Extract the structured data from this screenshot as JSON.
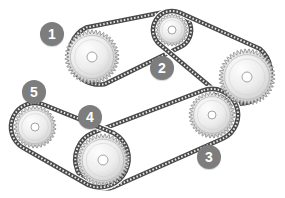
{
  "diagram": {
    "background_color": "#ffffff",
    "badge_color": "#7d7d7d",
    "badge_text_color": "#ffffff",
    "sprocket_fill_color": "#f2f2f2",
    "sprocket_tooth_color": "#a8a8a8",
    "sprocket_outline_color": "#8c8c8c",
    "chain_color": "#4a4a4a",
    "hub_color": "#ffffff"
  },
  "callouts": [
    {
      "id": "callout-1",
      "label": "1",
      "x": 40,
      "y": 22
    },
    {
      "id": "callout-2",
      "label": "2",
      "x": 150,
      "y": 56
    },
    {
      "id": "callout-3",
      "label": "3",
      "x": 197,
      "y": 145
    },
    {
      "id": "callout-4",
      "label": "4",
      "x": 78,
      "y": 105
    },
    {
      "id": "callout-5",
      "label": "5",
      "x": 22,
      "y": 80
    }
  ],
  "sprockets": [
    {
      "id": "sprocket-upper-left",
      "cx": 92,
      "cy": 57,
      "radius": 27,
      "teeth": 42,
      "hub_radius": 5
    },
    {
      "id": "sprocket-top-small",
      "cx": 172,
      "cy": 30,
      "radius": 16,
      "teeth": 26,
      "hub_radius": 4
    },
    {
      "id": "sprocket-right-large",
      "cx": 247,
      "cy": 77,
      "radius": 28,
      "teeth": 44,
      "hub_radius": 5
    },
    {
      "id": "sprocket-center-right",
      "cx": 212,
      "cy": 115,
      "radius": 23,
      "teeth": 36,
      "hub_radius": 4
    },
    {
      "id": "sprocket-bottom-mid",
      "cx": 103,
      "cy": 160,
      "radius": 26,
      "teeth": 40,
      "hub_radius": 5
    },
    {
      "id": "sprocket-left-small",
      "cx": 35,
      "cy": 127,
      "radius": 21,
      "teeth": 32,
      "hub_radius": 4
    }
  ],
  "chains": [
    {
      "id": "chain-1",
      "from": "sprocket-upper-left",
      "to": "sprocket-top-small"
    },
    {
      "id": "chain-2",
      "from": "sprocket-top-small",
      "to": "sprocket-right-large"
    },
    {
      "id": "chain-3",
      "from": "sprocket-center-right",
      "to": "sprocket-bottom-mid"
    },
    {
      "id": "chain-4",
      "from": "sprocket-bottom-mid",
      "to": "sprocket-left-small"
    }
  ]
}
